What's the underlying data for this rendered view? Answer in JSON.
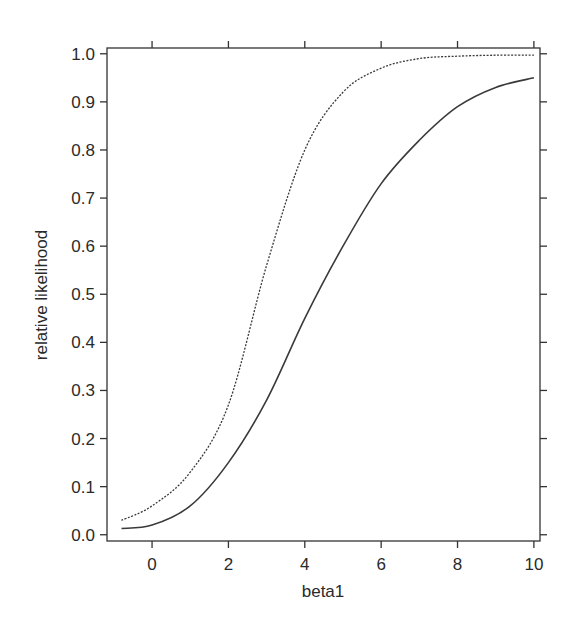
{
  "chart_data": {
    "type": "line",
    "title": "",
    "xlabel": "beta1",
    "ylabel": "relative likelihood",
    "xlim": [
      -1.18,
      10.16
    ],
    "ylim": [
      -0.013,
      1.012
    ],
    "x_ticks": [
      0,
      2,
      4,
      6,
      8,
      10
    ],
    "x_tick_labels": [
      "0",
      "2",
      "4",
      "6",
      "8",
      "10"
    ],
    "y_ticks": [
      0.0,
      0.1,
      0.2,
      0.3,
      0.4,
      0.5,
      0.6,
      0.7,
      0.8,
      0.9,
      1.0
    ],
    "y_tick_labels": [
      "0.0",
      "0.1",
      "0.2",
      "0.3",
      "0.4",
      "0.5",
      "0.6",
      "0.7",
      "0.8",
      "0.9",
      "1.0"
    ],
    "grid": false,
    "legend": null,
    "series": [
      {
        "name": "solid",
        "style": "solid",
        "x": [
          -0.8,
          0,
          1,
          2,
          3,
          4,
          5,
          6,
          7,
          8,
          9,
          10
        ],
        "values": [
          0.013,
          0.02,
          0.06,
          0.15,
          0.28,
          0.45,
          0.6,
          0.73,
          0.82,
          0.89,
          0.93,
          0.95
        ]
      },
      {
        "name": "dotted",
        "style": "dotted",
        "x": [
          -0.8,
          0,
          1,
          2,
          3,
          4,
          5,
          6,
          7,
          8,
          9,
          10
        ],
        "values": [
          0.03,
          0.06,
          0.13,
          0.27,
          0.56,
          0.8,
          0.92,
          0.97,
          0.99,
          0.995,
          0.997,
          0.997
        ]
      }
    ]
  },
  "plot": {
    "xlabel": "beta1",
    "ylabel": "relative likelihood"
  }
}
